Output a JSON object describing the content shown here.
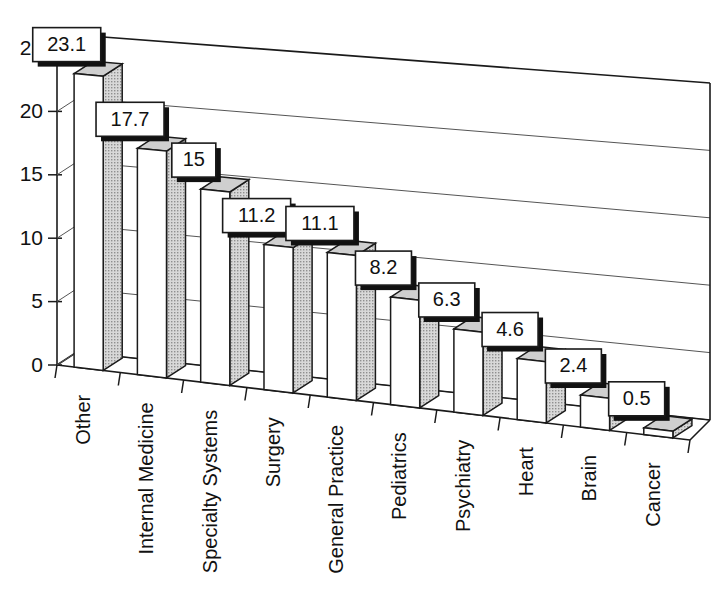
{
  "chart_data": {
    "type": "bar",
    "title": "",
    "subtitle": "",
    "xlabel": "",
    "ylabel": "",
    "categories": [
      "Other",
      "Internal Medicine",
      "Specialty Systems",
      "Surgery",
      "General Practice",
      "Pediatrics",
      "Psychiatry",
      "Heart",
      "Brain",
      "Cancer"
    ],
    "values": [
      23.1,
      17.7,
      15,
      11.2,
      11.1,
      8.2,
      6.3,
      4.6,
      2.4,
      0.5
    ],
    "data_labels": [
      "23.1",
      "17.7",
      "15",
      "11.2",
      "11.1",
      "8.2",
      "6.3",
      "4.6",
      "2.4",
      "0.5"
    ],
    "series": [
      {
        "name": "",
        "values": [
          23.1,
          17.7,
          15,
          11.2,
          11.1,
          8.2,
          6.3,
          4.6,
          2.4,
          0.5
        ]
      }
    ],
    "ylim": [
      0,
      25
    ],
    "yticks": [
      0,
      5,
      10,
      15,
      20,
      25
    ],
    "ytick_labels": [
      "0",
      "5",
      "10",
      "15",
      "20",
      "25"
    ],
    "grid": true,
    "grid_axis": "y",
    "legend": false,
    "legend_position": "none",
    "projection": "3d",
    "bar_style": {
      "front_color": "#ffffff",
      "side_color": "#b9b9b9",
      "top_color": "#cfcfcf",
      "edge_color": "#1a1a1a"
    },
    "label_box_style": {
      "fill": "#ffffff",
      "border": "#1a1a1a",
      "shadow": "#111111"
    },
    "category_label_rotation": -90
  }
}
